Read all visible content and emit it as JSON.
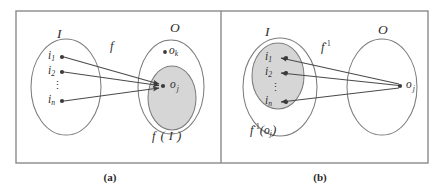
{
  "figure": {
    "background_color": "#ffffff",
    "frame_color": "#8a8a8a",
    "shade_color": "#d6d6d6",
    "outline_color": "#7d7d7d",
    "arrow_color": "#4a4a4a"
  },
  "panels": [
    {
      "id": "a",
      "caption": "(a)",
      "domain_label": "I",
      "codomain_label": "O",
      "mapping_label": "f",
      "mapping_label_sup": "",
      "image_label_fn": "f",
      "image_label_open": "(",
      "image_label_arg": "I",
      "image_label_close": ")",
      "image_label_full": "f(I)",
      "shaded_set": "O",
      "elements_left": [
        {
          "base": "i",
          "sub": "1"
        },
        {
          "base": "i",
          "sub": "2"
        },
        {
          "base": "i",
          "sub": "n"
        }
      ],
      "vertical_dots": "⋮",
      "elements_right": [
        {
          "base": "o",
          "sub": "k"
        },
        {
          "base": "o",
          "sub": "j"
        }
      ],
      "arrow_direction": "left-to-right",
      "arrow_count": 3
    },
    {
      "id": "b",
      "caption": "(b)",
      "domain_label": "I",
      "codomain_label": "O",
      "mapping_label": "f",
      "mapping_label_sup": "-1",
      "image_label_fn": "f",
      "image_label_sup": "-1",
      "image_label_open": "(",
      "image_label_arg_base": "o",
      "image_label_arg_sub": "j",
      "image_label_close": ")",
      "image_label_full": "f⁻¹(oⱼ)",
      "shaded_set": "I",
      "elements_left": [
        {
          "base": "i",
          "sub": "1"
        },
        {
          "base": "i",
          "sub": "2"
        },
        {
          "base": "i",
          "sub": "n"
        }
      ],
      "vertical_dots": "⋮",
      "elements_right": [
        {
          "base": "o",
          "sub": "j"
        }
      ],
      "arrow_direction": "right-to-left",
      "arrow_count": 3
    }
  ]
}
